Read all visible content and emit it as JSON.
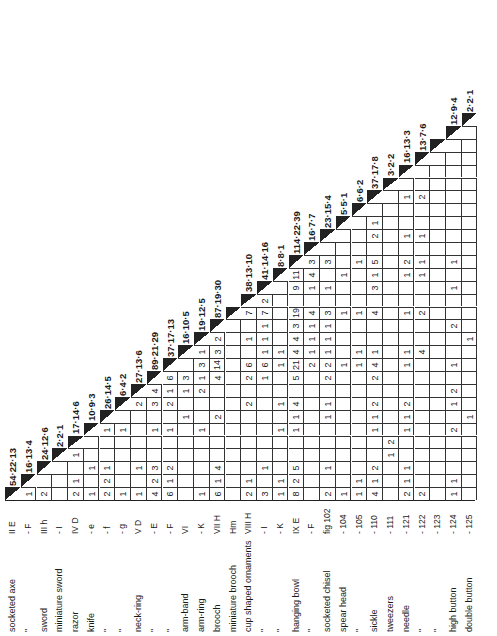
{
  "table": {
    "type": "triangular association matrix",
    "orientation": "rotated -90deg",
    "items": [
      {
        "name": "socketed axe",
        "code": "II E",
        "diag": "54·22·13"
      },
      {
        "name": "\"",
        "code": "- F",
        "diag": "16·13·4"
      },
      {
        "name": "sword",
        "code": "III h",
        "diag": "24·12·6"
      },
      {
        "name": "miniature sword",
        "code": "- I",
        "diag": "2·2·1"
      },
      {
        "name": "razor",
        "code": "IV D",
        "diag": "17·14·6"
      },
      {
        "name": "knife",
        "code": "- e",
        "diag": "10·9·3"
      },
      {
        "name": "\"",
        "code": "- f",
        "diag": "26·14·5"
      },
      {
        "name": "\"",
        "code": "- g",
        "diag": "6·4·2"
      },
      {
        "name": "neck-ring",
        "code": "V D",
        "diag": "27·13·6"
      },
      {
        "name": "\"",
        "code": "- E",
        "diag": "89·21·29"
      },
      {
        "name": "\"",
        "code": "- F",
        "diag": "37·17·13"
      },
      {
        "name": "arm-band",
        "code": "VI",
        "diag": "16·10·5"
      },
      {
        "name": "arm-ring",
        "code": "- K",
        "diag": "19·12·5"
      },
      {
        "name": "brooch",
        "code": "VII H",
        "diag": "87·19·30"
      },
      {
        "name": "miniature brooch",
        "code": "Hm",
        "diag": ""
      },
      {
        "name": "cup shaped ornaments",
        "code": "VIII H",
        "diag": "38·13·10"
      },
      {
        "name": "\"",
        "code": "- I",
        "diag": "41·14·16"
      },
      {
        "name": "\"",
        "code": "- K",
        "diag": "8·8·1"
      },
      {
        "name": "hanging bowl",
        "code": "IX E",
        "diag": "114·22·39"
      },
      {
        "name": "\"",
        "code": "- F",
        "diag": "16·7·7"
      },
      {
        "name": "socketed chisel",
        "code": "fig 102",
        "diag": "23·15·4"
      },
      {
        "name": "spear head",
        "code": "- 104",
        "diag": "5·5·1"
      },
      {
        "name": "\"",
        "code": "- 105",
        "diag": "6·6·2"
      },
      {
        "name": "sickle",
        "code": "- 110",
        "diag": "37·17·8"
      },
      {
        "name": "tweezers",
        "code": "- 111",
        "diag": "3·2·2"
      },
      {
        "name": "needle",
        "code": "- 121",
        "diag": "16·13·3"
      },
      {
        "name": "\"",
        "code": "- 122",
        "diag": "13·7·6"
      },
      {
        "name": "\"",
        "code": "- 123",
        "diag": ""
      },
      {
        "name": "high button",
        "code": "- 124",
        "diag": "12·9·4"
      },
      {
        "name": "double button",
        "code": "- 125",
        "diag": "2·2·1"
      }
    ],
    "cells": {
      "2": {
        "1": "1"
      },
      "3": {
        "1": "2"
      },
      "5": {
        "1": "2",
        "2": "1",
        "4": "1"
      },
      "6": {
        "1": "1",
        "3": "1"
      },
      "7": {
        "1": "2",
        "2": "2",
        "3": "1",
        "6": "1"
      },
      "8": {
        "1": "1",
        "6": "1"
      },
      "9": {
        "1": "1",
        "3": "1",
        "8": "2"
      },
      "10": {
        "1": "4",
        "2": "2",
        "3": "3",
        "6": "1",
        "8": "3",
        "9": "4"
      },
      "11": {
        "1": "6",
        "2": "1",
        "3": "2",
        "6": "1",
        "8": "2",
        "9": "1",
        "10": "6"
      },
      "12": {
        "7": "1",
        "9": "1",
        "10": "3"
      },
      "13": {
        "1": "1",
        "6": "1",
        "9": "2",
        "10": "1",
        "11": "3",
        "12": "1"
      },
      "14": {
        "1": "6",
        "2": "1",
        "3": "4",
        "7": "2",
        "10": "4",
        "11": "14",
        "12": "3",
        "13": "2",
        "14": "2"
      },
      "16": {
        "1": "2",
        "2": "1",
        "8": "2",
        "10": "2",
        "11": "6",
        "13": "1",
        "15": "7"
      },
      "17": {
        "1": "3",
        "3": "1",
        "10": "1",
        "11": "6",
        "12": "1",
        "13": "1",
        "14": "1",
        "15": "7",
        "16": "2"
      },
      "18": {
        "1": "1",
        "2": "1",
        "6": "1",
        "8": "1",
        "11": "1",
        "12": "1"
      },
      "19": {
        "1": "8",
        "2": "2",
        "3": "5",
        "6": "1",
        "7": "1",
        "8": "4",
        "10": "5",
        "11": "21",
        "12": "4",
        "13": "4",
        "14": "3",
        "15": "19",
        "17": "9",
        "18": "11",
        "19": "1"
      },
      "20": {
        "11": "2",
        "12": "1",
        "13": "1",
        "14": "1",
        "15": "4",
        "17": "1",
        "18": "4",
        "19": "3"
      },
      "21": {
        "1": "2",
        "3": "1",
        "7": "1",
        "8": "1",
        "10": "2",
        "11": "2",
        "12": "1",
        "13": "1",
        "14": "1",
        "15": "3",
        "17": "1",
        "19": "3"
      },
      "22": {
        "1": "1",
        "11": "1",
        "15": "1",
        "18": "1"
      },
      "23": {
        "1": "1",
        "2": "1",
        "11": "1",
        "12": "1",
        "15": "1",
        "19": "1"
      },
      "24": {
        "1": "4",
        "2": "1",
        "3": "2",
        "6": "1",
        "7": "1",
        "8": "2",
        "10": "2",
        "11": "4",
        "12": "1",
        "15": "4",
        "17": "3",
        "18": "1",
        "19": "5",
        "21": "2",
        "22": "1"
      },
      "25": {
        "4": "1",
        "5": "2"
      },
      "26": {
        "1": "2",
        "2": "1",
        "3": "1",
        "6": "1",
        "7": "1",
        "8": "2",
        "11": "1",
        "12": "1",
        "15": "1",
        "18": "1",
        "19": "2",
        "21": "1",
        "24": "1"
      },
      "27": {
        "1": "2",
        "12": "4",
        "15": "2",
        "18": "1",
        "19": "1",
        "21": "1",
        "24": "2"
      },
      "29": {
        "1": "1",
        "2": "1",
        "6": "2",
        "8": "1",
        "9": "2",
        "11": "1",
        "14": "2",
        "17": "1",
        "19": "1"
      },
      "30": {
        "7": "1",
        "13": "1"
      }
    }
  }
}
